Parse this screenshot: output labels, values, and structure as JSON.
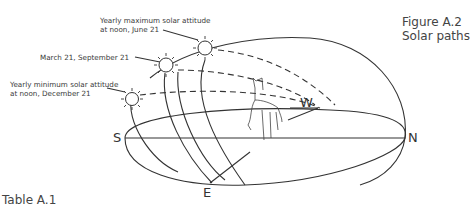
{
  "figure": {
    "number": "Figure A.2",
    "title": "Solar paths"
  },
  "table_label": "Table A.1",
  "annotations": {
    "max": {
      "line1": "Yearly maximum solar attitude",
      "line2": "at noon, June 21"
    },
    "equinox": "March 21, September 21",
    "min": {
      "line1": "Yearly minimum solar attitude",
      "line2": "at noon, December 21"
    }
  },
  "directions": {
    "south": "S",
    "north": "N",
    "east": "E",
    "west": "W"
  },
  "colors": {
    "ink": "#333333",
    "background": "#ffffff"
  }
}
